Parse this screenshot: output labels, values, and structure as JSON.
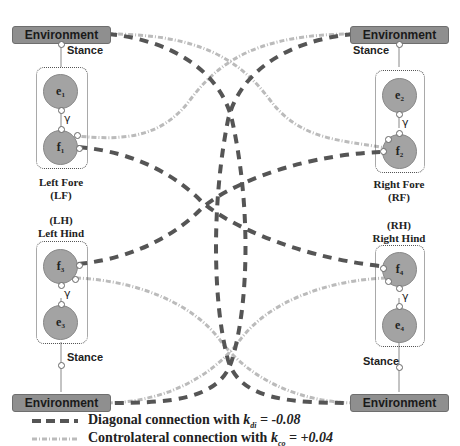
{
  "environment": {
    "top_left": "Environment",
    "top_right": "Environment",
    "bottom_left": "Environment",
    "bottom_right": "Environment"
  },
  "stance_label": "Stance",
  "gamma_symbol": "γ",
  "limbs": {
    "left_fore": {
      "name": "Left Fore",
      "abbr": "(LF)",
      "nodes": [
        {
          "base": "e",
          "sub": "1"
        },
        {
          "base": "f",
          "sub": "1"
        }
      ]
    },
    "right_fore": {
      "name": "Right Fore",
      "abbr": "(RF)",
      "nodes": [
        {
          "base": "e",
          "sub": "2"
        },
        {
          "base": "f",
          "sub": "2"
        }
      ]
    },
    "left_hind": {
      "name": "Left Hind",
      "abbr": "(LH)",
      "nodes": [
        {
          "base": "f",
          "sub": "3"
        },
        {
          "base": "e",
          "sub": "3"
        }
      ]
    },
    "right_hind": {
      "name": "Right Hind",
      "abbr": "(RH)",
      "nodes": [
        {
          "base": "f",
          "sub": "4"
        },
        {
          "base": "e",
          "sub": "4"
        }
      ]
    }
  },
  "legend": {
    "diagonal": {
      "prefix": "Diagonal connection with ",
      "k": "k",
      "sub": "di",
      "value": " = -0.08",
      "color": "#555555"
    },
    "contralateral": {
      "prefix": "Controlateral connection with ",
      "k": "k",
      "sub": "co",
      "value": " = +0.04",
      "color": "#b8b8b8"
    }
  },
  "colors": {
    "node_fill": "#a3a3a3",
    "env_fill": "#8f8f8f",
    "diagonal": "#555555",
    "contralateral": "#bbbbbb"
  }
}
